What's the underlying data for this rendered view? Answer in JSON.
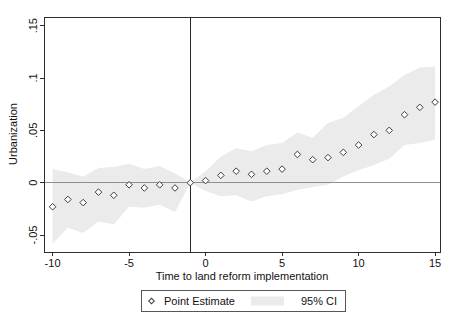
{
  "chart_data": {
    "type": "scatter",
    "title": "",
    "xlabel": "Time to land reform implementation",
    "ylabel": "Urbanization",
    "grid": false,
    "legend_position": "bottom-outside",
    "xlim": [
      -10.56,
      15.32
    ],
    "ylim": [
      -0.0662,
      0.1583
    ],
    "x_ticks": {
      "values": [
        -10,
        -5,
        0,
        5,
        10,
        15
      ],
      "labels": [
        "-10",
        "-5",
        "0",
        "5",
        "10",
        "15"
      ]
    },
    "y_ticks": {
      "values": [
        -0.05,
        0,
        0.05,
        0.1,
        0.15
      ],
      "labels": [
        "-.05",
        "0",
        ".05",
        ".1",
        ".15"
      ]
    },
    "reference_line_x": -1,
    "zero_line_y": 0,
    "x": [
      -10,
      -9,
      -8,
      -7,
      -6,
      -5,
      -4,
      -3,
      -2,
      -1,
      0,
      1,
      2,
      3,
      4,
      5,
      6,
      7,
      8,
      9,
      10,
      11,
      12,
      13,
      14,
      15
    ],
    "series": [
      {
        "name": "Point Estimate",
        "type": "scatter",
        "marker": "hollow-diamond",
        "values": [
          -0.023,
          -0.016,
          -0.019,
          -0.009,
          -0.012,
          -0.002,
          -0.005,
          -0.002,
          -0.005,
          0,
          0.002,
          0.007,
          0.011,
          0.008,
          0.011,
          0.013,
          0.027,
          0.022,
          0.024,
          0.029,
          0.036,
          0.046,
          0.05,
          0.065,
          0.072,
          0.077
        ]
      },
      {
        "name": "95% CI",
        "type": "band",
        "upper": [
          0.013,
          0.01,
          0.006,
          0.014,
          0.015,
          0.018,
          0.013,
          0.016,
          0.009,
          0,
          0.011,
          0.025,
          0.033,
          0.03,
          0.036,
          0.038,
          0.048,
          0.043,
          0.057,
          0.062,
          0.073,
          0.084,
          0.092,
          0.103,
          0.11,
          0.111
        ],
        "lower": [
          -0.058,
          -0.043,
          -0.048,
          -0.037,
          -0.04,
          -0.023,
          -0.024,
          -0.021,
          -0.028,
          0,
          -0.008,
          -0.013,
          -0.012,
          -0.018,
          -0.013,
          -0.011,
          -0.007,
          -0.004,
          -0.002,
          0.006,
          0.012,
          0.017,
          0.023,
          0.036,
          0.038,
          0.041
        ]
      }
    ],
    "colors": {
      "background": "#ffffff",
      "ci_band": "#ebebeb",
      "marker": "#3d3d3d",
      "axis_frame": "#2e2e2e",
      "zero_line": "#8f8f8f",
      "reference_line": "#262626",
      "text": "#111111",
      "legend_border": "#565656"
    },
    "plot_rect_px": {
      "left": 44,
      "top": 17,
      "right": 440,
      "bottom": 252
    }
  }
}
